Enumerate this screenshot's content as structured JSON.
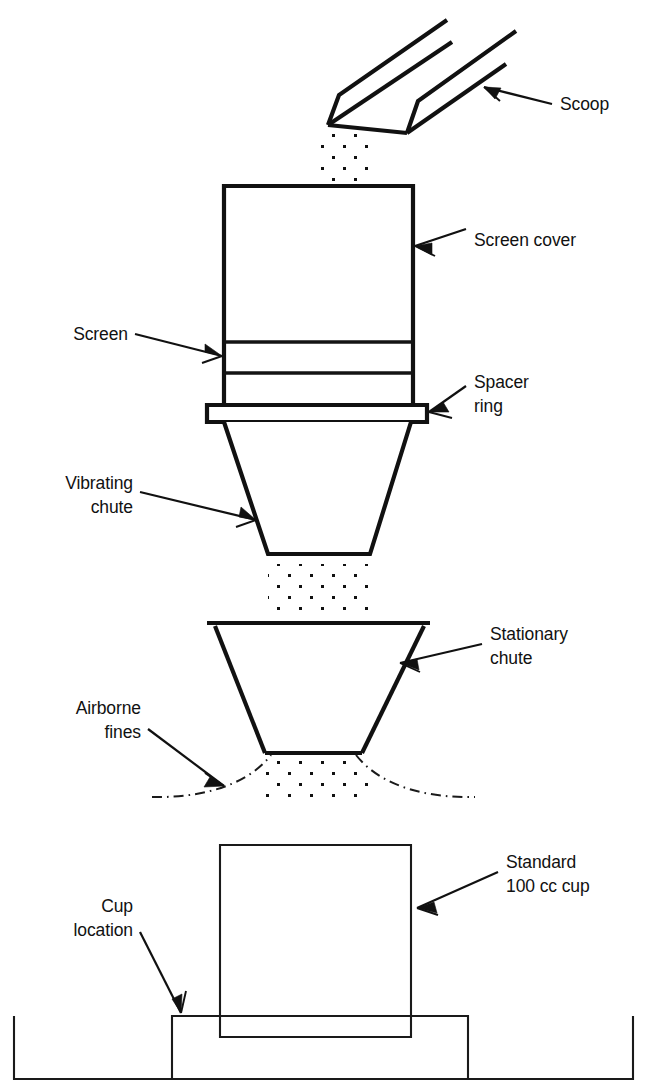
{
  "diagram": {
    "background_color": "#ffffff",
    "line_color": "#111111",
    "labels": {
      "scoop": "Scoop",
      "screen_cover": "Screen cover",
      "screen": "Screen",
      "spacer_ring_line1": "Spacer",
      "spacer_ring_line2": "ring",
      "vibrating_chute_line1": "Vibrating",
      "vibrating_chute_line2": "chute",
      "stationary_chute_line1": "Stationary",
      "stationary_chute_line2": "chute",
      "airborne_fines_line1": "Airborne",
      "airborne_fines_line2": "fines",
      "standard_cup_line1": "Standard",
      "standard_cup_line2": "100 cc cup",
      "cup_location_line1": "Cup",
      "cup_location_line2": "location"
    },
    "components": [
      {
        "name": "scoop",
        "kind": "v-channel-scoop"
      },
      {
        "name": "powder-stream-from-scoop",
        "kind": "dot-fill"
      },
      {
        "name": "screen-cover",
        "kind": "rectangle"
      },
      {
        "name": "screen",
        "kind": "band"
      },
      {
        "name": "spacer-ring",
        "kind": "flange"
      },
      {
        "name": "vibrating-chute",
        "kind": "funnel"
      },
      {
        "name": "powder-stream-mid",
        "kind": "dot-fill"
      },
      {
        "name": "stationary-chute",
        "kind": "funnel"
      },
      {
        "name": "airborne-fines",
        "kind": "dash-dot-arcs"
      },
      {
        "name": "powder-stream-lower",
        "kind": "dot-fill"
      },
      {
        "name": "standard-cup",
        "kind": "rectangle"
      },
      {
        "name": "cup-pedestal",
        "kind": "platform"
      },
      {
        "name": "collection-tray",
        "kind": "tray"
      }
    ]
  }
}
